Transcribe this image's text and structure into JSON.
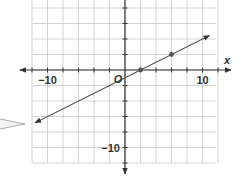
{
  "chart_data": {
    "type": "line",
    "title": "",
    "xlabel": "x",
    "ylabel": "",
    "origin_label": "O",
    "xlim": [
      -12,
      12
    ],
    "ylim": [
      -12,
      9
    ],
    "grid": true,
    "grid_step": 2,
    "tick_step": 1,
    "x_tick_labels": [
      {
        "value": -10,
        "label": "−10"
      },
      {
        "value": 10,
        "label": "10"
      }
    ],
    "y_tick_labels": [
      {
        "value": -10,
        "label": "−10"
      }
    ],
    "series": [
      {
        "name": "line",
        "equation": "y = 0.5x - 1",
        "slope": 0.5,
        "intercept": -1,
        "x": [
          -11.6,
          10.9
        ],
        "y": [
          -6.8,
          4.45
        ],
        "arrows_both_ends": true,
        "marked_points": [
          {
            "x": 2,
            "y": 0
          },
          {
            "x": 6,
            "y": 2
          }
        ]
      }
    ],
    "annotations": [
      {
        "type": "callout-pointer",
        "points_to": "lower-left arrow of line"
      }
    ]
  },
  "colors": {
    "axis": "#333333",
    "grid": "#c8c8c8",
    "line": "#555555",
    "point": "#555555"
  }
}
